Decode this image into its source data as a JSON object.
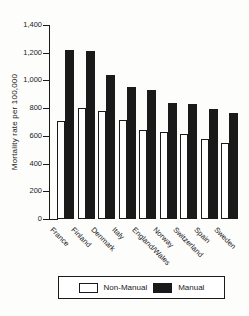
{
  "figure": {
    "colors": {
      "ink": "#1a1a1a",
      "paper": "#ffffff",
      "background": "#fdfdfc"
    }
  },
  "chart_data": {
    "type": "bar",
    "title": "",
    "xlabel": "",
    "ylabel": "Mortality rate per 100,000",
    "categories": [
      "France",
      "Finland",
      "Denmark",
      "Italy",
      "England/Wales",
      "Norway",
      "Switzerland",
      "Spain",
      "Sweden"
    ],
    "series": [
      {
        "name": "Non-Manual",
        "fill": "white",
        "values": [
          710,
          800,
          780,
          715,
          645,
          625,
          615,
          575,
          545
        ]
      },
      {
        "name": "Manual",
        "fill": "black",
        "values": [
          1220,
          1215,
          1040,
          955,
          930,
          840,
          830,
          795,
          765
        ]
      }
    ],
    "ylim": [
      0,
      1400
    ],
    "ytick_interval": 200,
    "ytick_labels": [
      "0",
      "200",
      "400",
      "600",
      "800",
      "1,000",
      "1,200",
      "1,400"
    ],
    "grid": false,
    "legend": {
      "position": "bottom",
      "entries": [
        "Non-Manual",
        "Manual"
      ]
    }
  }
}
